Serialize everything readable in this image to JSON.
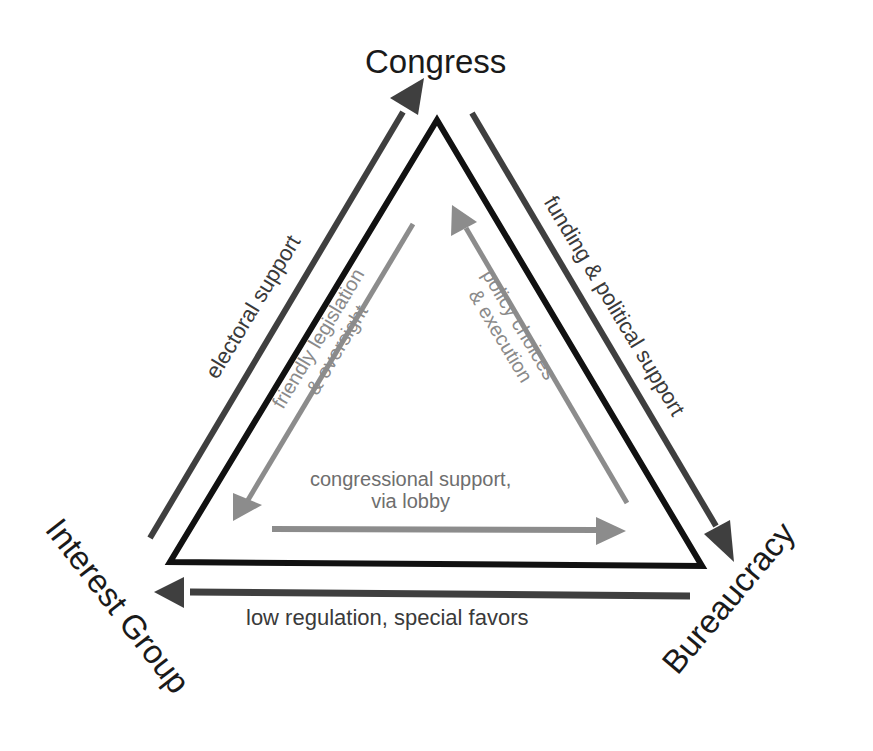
{
  "diagram": {
    "type": "iron-triangle",
    "nodes": {
      "congress": {
        "label": "Congress"
      },
      "interest_group": {
        "label": "Interest Group"
      },
      "bureaucracy": {
        "label": "Bureaucracy"
      }
    },
    "outer_flows": {
      "electoral_support": {
        "label": "electoral support",
        "from": "Interest Group",
        "to": "Congress"
      },
      "funding_political_support": {
        "label": "funding & political support",
        "from": "Congress",
        "to": "Bureaucracy"
      },
      "low_regulation": {
        "label": "low regulation, special favors",
        "from": "Bureaucracy",
        "to": "Interest Group"
      }
    },
    "inner_flows": {
      "friendly_legislation": {
        "line1": "friendly legislation",
        "line2": "& oversight",
        "from": "Congress",
        "to": "Interest Group"
      },
      "policy_choices": {
        "line1": "policy choices",
        "line2": "& execution",
        "from": "Bureaucracy",
        "to": "Congress"
      },
      "congressional_support": {
        "line1": "congressional support,",
        "line2": "via lobby",
        "from": "Interest Group",
        "to": "Bureaucracy"
      }
    },
    "colors": {
      "triangle": "#111111",
      "outer_arrow": "#3f3f3f",
      "inner_arrow": "#8c8c8c",
      "background": "#ffffff"
    }
  }
}
